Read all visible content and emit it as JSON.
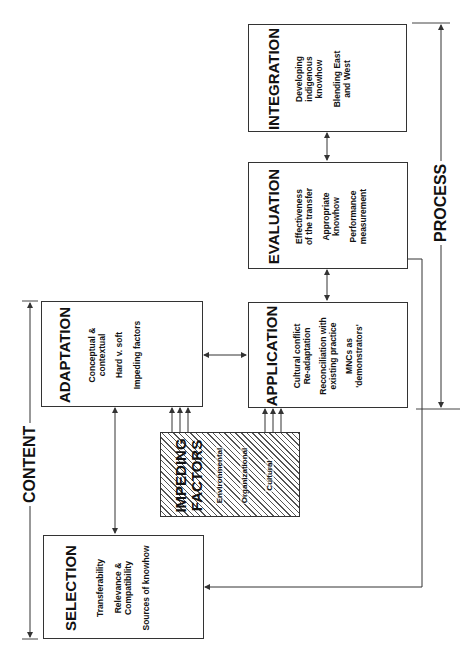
{
  "diagram": {
    "brackets": {
      "content": "CONTENT",
      "process": "PROCESS"
    },
    "boxes": {
      "selection": {
        "title": "SELECTION",
        "items": [
          "Transferability",
          "Relevance &\nCompatibility",
          "Sources of knowhow"
        ]
      },
      "adaptation": {
        "title": "ADAPTATION",
        "items": [
          "Conceptual &\ncontextual",
          "Hard v. soft",
          "Impeding factors"
        ]
      },
      "impeding_factors": {
        "title": "IMPEDING\nFACTORS",
        "items": [
          "Environmental",
          "Organizational",
          "Cultural"
        ]
      },
      "application": {
        "title": "APPLICATION",
        "items": [
          "Cultural conflict\nRe-adaptation",
          "Reconciliation with\nexisting practice",
          "MNCs as\n'demonstrators'"
        ]
      },
      "evaluation": {
        "title": "EVALUATION",
        "items": [
          "Effectiveness\nof the transfer",
          "Appropriate\nknowhow",
          "Performance\nmeasurement"
        ]
      },
      "integration": {
        "title": "INTEGRATION",
        "items": [
          "Developing\nindigenous\nknowhow",
          "Blending East\nand West"
        ]
      }
    },
    "colors": {
      "line": "#333333",
      "hatch": "#555555",
      "background": "#ffffff"
    }
  }
}
